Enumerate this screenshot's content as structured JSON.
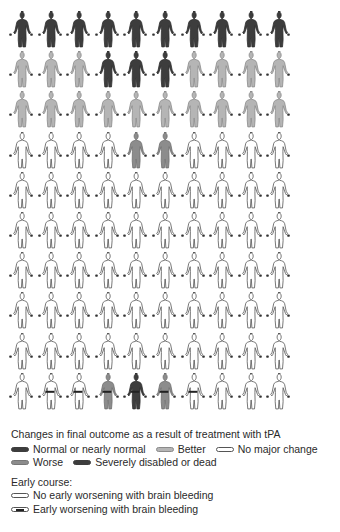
{
  "colors": {
    "normal": "#3d3d3d",
    "better": "#b5b5b5",
    "none": "#ffffff",
    "worse": "#8c8c8c",
    "dead": "#3d3d3d",
    "outline": "#555555",
    "bleed_bar": "#222222"
  },
  "chart_data": {
    "type": "pictograph",
    "title": "Changes in final outcome as a result of treatment with tPA",
    "grid": {
      "rows": 10,
      "cols": 10,
      "unit": "1 patient out of 100"
    },
    "rows": [
      [
        "normal",
        "normal",
        "normal",
        "normal",
        "normal",
        "normal",
        "normal",
        "normal",
        "normal",
        "normal"
      ],
      [
        "better",
        "better",
        "better",
        "normal",
        "normal",
        "normal",
        "better",
        "better",
        "better",
        "better"
      ],
      [
        "better",
        "better",
        "better",
        "better",
        "better",
        "better",
        "better",
        "better",
        "better",
        "better"
      ],
      [
        "none",
        "none",
        "none",
        "none",
        "worse",
        "worse",
        "none",
        "none",
        "none",
        "none"
      ],
      [
        "none",
        "none",
        "none",
        "none",
        "none",
        "none",
        "none",
        "none",
        "none",
        "none"
      ],
      [
        "none",
        "none",
        "none",
        "none",
        "none",
        "none",
        "none",
        "none",
        "none",
        "none"
      ],
      [
        "none",
        "none",
        "none",
        "none",
        "none",
        "none",
        "none",
        "none",
        "none",
        "none"
      ],
      [
        "none",
        "none",
        "none",
        "none",
        "none",
        "none",
        "none",
        "none",
        "none",
        "none"
      ],
      [
        "none",
        "none",
        "none",
        "none",
        "none",
        "none",
        "none",
        "none",
        "none",
        "none"
      ],
      [
        "none",
        "none",
        "none",
        "worse",
        "dead",
        "worse",
        "none",
        "none",
        "none",
        "none"
      ]
    ],
    "bleeding_rows": [
      [
        0,
        0,
        0,
        0,
        0,
        0,
        0,
        0,
        0,
        0
      ],
      [
        0,
        0,
        0,
        0,
        0,
        0,
        0,
        0,
        0,
        0
      ],
      [
        0,
        0,
        0,
        0,
        0,
        0,
        0,
        0,
        0,
        0
      ],
      [
        0,
        0,
        0,
        0,
        0,
        0,
        0,
        0,
        0,
        0
      ],
      [
        0,
        0,
        0,
        0,
        0,
        0,
        0,
        0,
        0,
        0
      ],
      [
        0,
        0,
        0,
        0,
        0,
        0,
        0,
        0,
        0,
        0
      ],
      [
        0,
        0,
        0,
        0,
        0,
        0,
        0,
        0,
        0,
        0
      ],
      [
        0,
        0,
        0,
        0,
        0,
        0,
        0,
        0,
        0,
        0
      ],
      [
        0,
        0,
        0,
        0,
        0,
        0,
        0,
        0,
        0,
        0
      ],
      [
        0,
        1,
        1,
        1,
        1,
        1,
        1,
        0,
        0,
        0
      ]
    ],
    "counts": {
      "normal": 13,
      "better": 17,
      "none": 66,
      "worse": 3,
      "dead": 1,
      "early_worsening_with_bleeding": 6
    }
  },
  "legend": {
    "title": "Changes in final outcome as a result of treatment with tPA",
    "items": [
      {
        "key": "normal",
        "label": "Normal or nearly normal"
      },
      {
        "key": "better",
        "label": "Better"
      },
      {
        "key": "none",
        "label": "No major change"
      },
      {
        "key": "worse",
        "label": "Worse"
      },
      {
        "key": "dead",
        "label": "Severely disabled or dead"
      }
    ],
    "early_title": "Early course:",
    "early_items": [
      {
        "key": "no_bleed",
        "label": "No early worsening with brain bleeding"
      },
      {
        "key": "bleed",
        "label": "Early worsening with brain bleeding"
      }
    ]
  }
}
